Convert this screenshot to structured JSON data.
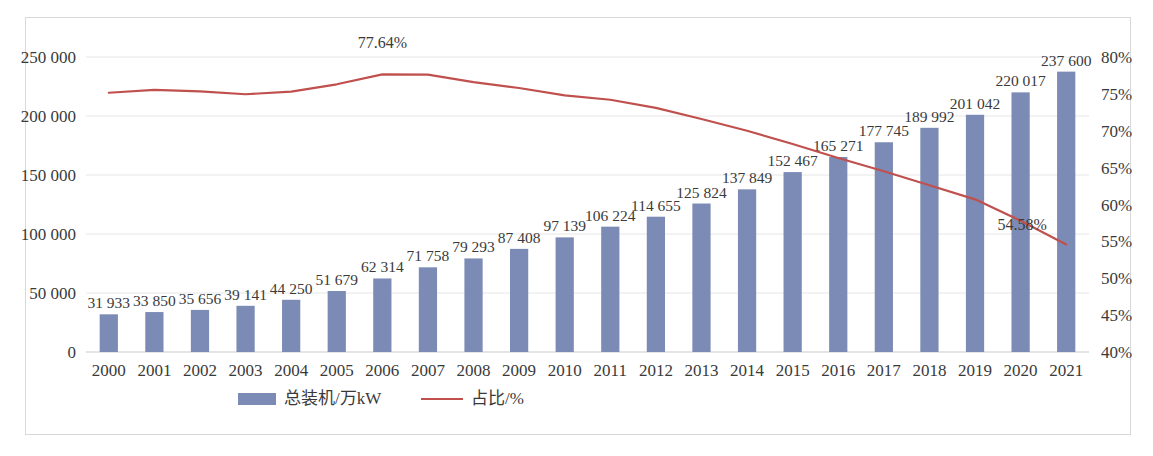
{
  "chart_data": {
    "type": "bar",
    "title": "",
    "xlabel": "",
    "ylabel": "",
    "y2label": "",
    "grid": true,
    "legend_position": "bottom",
    "categories": [
      "2000",
      "2001",
      "2002",
      "2003",
      "2004",
      "2005",
      "2006",
      "2007",
      "2008",
      "2009",
      "2010",
      "2011",
      "2012",
      "2013",
      "2014",
      "2015",
      "2016",
      "2017",
      "2018",
      "2019",
      "2020",
      "2021"
    ],
    "ylim": [
      0,
      250000
    ],
    "yticks": [
      "0",
      "50 000",
      "100 000",
      "150 000",
      "200 000",
      "250 000"
    ],
    "ytick_values": [
      0,
      50000,
      100000,
      150000,
      200000,
      250000
    ],
    "y2lim": [
      40,
      80
    ],
    "y2ticks": [
      "40%",
      "45%",
      "50%",
      "55%",
      "60%",
      "65%",
      "70%",
      "75%",
      "80%"
    ],
    "y2tick_values": [
      40,
      45,
      50,
      55,
      60,
      65,
      70,
      75,
      80
    ],
    "series": [
      {
        "name": "总装机/万kW",
        "kind": "bar",
        "axis": "left",
        "color": "#7b8bb5",
        "values": [
          31933,
          33850,
          35656,
          39141,
          44250,
          51679,
          62314,
          71758,
          79293,
          87408,
          97139,
          106224,
          114655,
          125824,
          137849,
          152467,
          165271,
          177745,
          189992,
          201042,
          220017,
          237600
        ],
        "labels": [
          "31 933",
          "33 850",
          "35 656",
          "39 141",
          "44 250",
          "51 679",
          "62 314",
          "71 758",
          "79 293",
          "87 408",
          "97 139",
          "106 224",
          "114 655",
          "125 824",
          "137 849",
          "152 467",
          "165 271",
          "177 745",
          "189 992",
          "201 042",
          "220 017",
          "237 600"
        ]
      },
      {
        "name": "占比/%",
        "kind": "line",
        "axis": "right",
        "color": "#c0504d",
        "values": [
          75.15,
          75.55,
          75.35,
          74.95,
          75.3,
          76.3,
          77.64,
          77.6,
          76.6,
          75.8,
          74.8,
          74.2,
          73.1,
          71.6,
          70.0,
          68.2,
          66.3,
          64.5,
          62.6,
          60.7,
          57.8,
          54.58
        ]
      }
    ],
    "annotations": [
      {
        "series": "占比/%",
        "category": "2006",
        "text": "77.64%",
        "dx": 0,
        "dy": -26
      },
      {
        "series": "占比/%",
        "category": "2021",
        "text": "54.58%",
        "dx": -44,
        "dy": -14
      }
    ]
  },
  "legend": {
    "items": [
      {
        "label": "总装机/万kW",
        "marker": "bar-swatch",
        "color": "#7b8bb5"
      },
      {
        "label": "占比/%",
        "marker": "line-swatch",
        "color": "#c0504d"
      }
    ]
  }
}
